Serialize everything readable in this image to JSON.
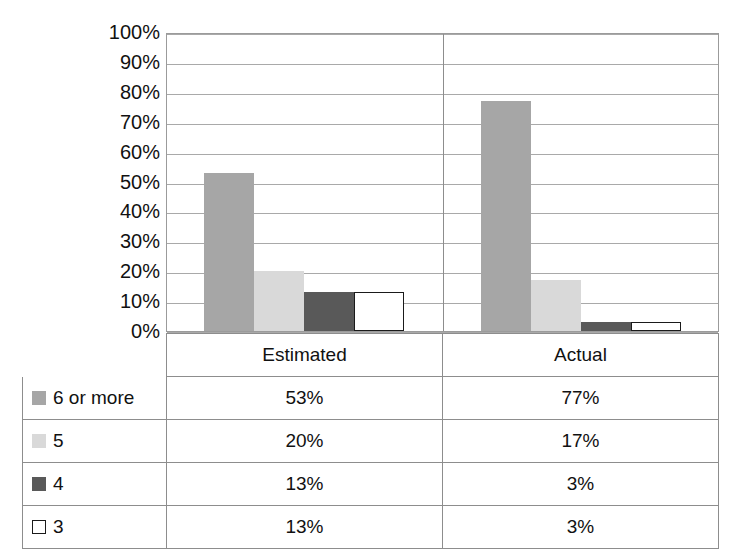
{
  "chart_data": {
    "type": "bar",
    "title": "",
    "subtitle": "",
    "xlabel": "",
    "ylabel": "",
    "grid": true,
    "legend_position": "table-below",
    "categories": [
      "Estimated",
      "Actual"
    ],
    "ylim": [
      0,
      100
    ],
    "y_ticks": [
      "0%",
      "10%",
      "20%",
      "30%",
      "40%",
      "50%",
      "60%",
      "70%",
      "80%",
      "90%",
      "100%"
    ],
    "y_tick_values": [
      0,
      10,
      20,
      30,
      40,
      50,
      60,
      70,
      80,
      90,
      100
    ],
    "series": [
      {
        "name": "6 or more",
        "values": [
          53,
          77
        ],
        "labels": [
          "53%",
          "77%"
        ],
        "color": "#a6a6a6",
        "border": "#a6a6a6"
      },
      {
        "name": "5",
        "values": [
          20,
          17
        ],
        "labels": [
          "20%",
          "17%"
        ],
        "color": "#d9d9d9",
        "border": "#d9d9d9"
      },
      {
        "name": "4",
        "values": [
          13,
          3
        ],
        "labels": [
          "13%",
          "3%"
        ],
        "color": "#595959",
        "border": "#595959"
      },
      {
        "name": "3",
        "values": [
          13,
          3
        ],
        "labels": [
          "13%",
          "3%"
        ],
        "color": "#ffffff",
        "border": "#1a1a1a"
      }
    ]
  },
  "axis": {
    "y_labels": [
      "100%",
      "90%",
      "80%",
      "70%",
      "60%",
      "50%",
      "40%",
      "30%",
      "20%",
      "10%",
      "0%"
    ]
  },
  "table": {
    "header": {
      "legend_blank": "",
      "columns": [
        "Estimated",
        "Actual"
      ]
    },
    "rows": [
      {
        "label": "6 or more",
        "swatch": "#a6a6a6",
        "swatch_border": "#a6a6a6",
        "estimated": "53%",
        "actual": "77%"
      },
      {
        "label": "5",
        "swatch": "#d9d9d9",
        "swatch_border": "#d9d9d9",
        "estimated": "20%",
        "actual": "17%"
      },
      {
        "label": "4",
        "swatch": "#595959",
        "swatch_border": "#595959",
        "estimated": "13%",
        "actual": "3%"
      },
      {
        "label": "3",
        "swatch": "#ffffff",
        "swatch_border": "#1a1a1a",
        "estimated": "13%",
        "actual": "3%"
      }
    ]
  }
}
